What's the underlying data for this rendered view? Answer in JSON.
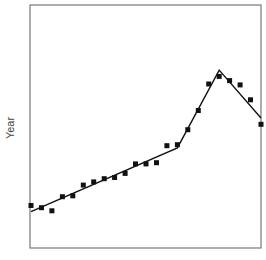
{
  "chart_data": {
    "type": "scatter",
    "title": "",
    "xlabel": "",
    "ylabel": "Year",
    "grid": false,
    "legend": null,
    "xlim": [
      0,
      22
    ],
    "ylim": [
      0,
      100
    ],
    "series": [
      {
        "name": "observed",
        "kind": "scatter",
        "marker": "square",
        "color": "#111111",
        "x": [
          0,
          1,
          2,
          3,
          4,
          5,
          6,
          7,
          8,
          9,
          10,
          11,
          12,
          13,
          14,
          15,
          16,
          17,
          18,
          19,
          20,
          21,
          22
        ],
        "y": [
          17.5,
          16.6,
          15.3,
          21.1,
          21.5,
          25.9,
          27.2,
          28.5,
          29.0,
          30.7,
          34.6,
          34.6,
          35.1,
          42.1,
          42.5,
          48.7,
          56.6,
          67.5,
          70.6,
          68.9,
          67.1,
          61.0,
          50.9
        ]
      },
      {
        "name": "segmented fit",
        "kind": "line",
        "color": "#111111",
        "x": [
          0,
          14,
          18,
          22
        ],
        "y": [
          15.0,
          41.2,
          73.2,
          53.5
        ]
      }
    ]
  },
  "axis": {
    "y_label": "Year"
  }
}
